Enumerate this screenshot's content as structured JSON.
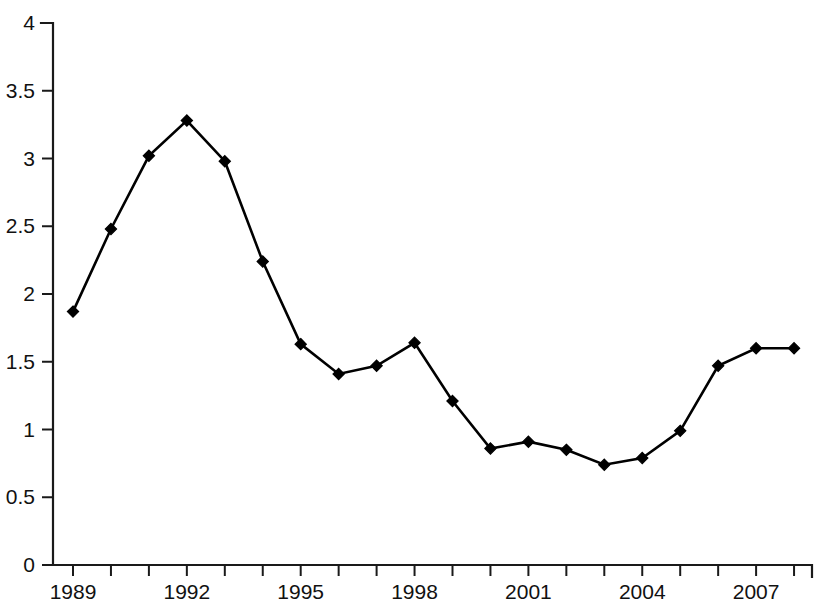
{
  "chart_data": {
    "type": "line",
    "title": "",
    "subtitle": "",
    "xlabel": "",
    "ylabel": "",
    "x": [
      1989,
      1990,
      1991,
      1992,
      1993,
      1994,
      1995,
      1996,
      1997,
      1998,
      1999,
      2000,
      2001,
      2002,
      2003,
      2004,
      2005,
      2006,
      2007,
      2008
    ],
    "values": [
      1.87,
      2.48,
      3.02,
      3.28,
      2.98,
      2.24,
      1.63,
      1.41,
      1.47,
      1.64,
      1.21,
      0.86,
      0.91,
      0.85,
      0.74,
      0.79,
      0.99,
      1.47,
      1.6,
      1.6
    ],
    "series": [
      {
        "name": "series-1",
        "values": [
          1.87,
          2.48,
          3.02,
          3.28,
          2.98,
          2.24,
          1.63,
          1.41,
          1.47,
          1.64,
          1.21,
          0.86,
          0.91,
          0.85,
          0.74,
          0.79,
          0.99,
          1.47,
          1.6,
          1.6
        ],
        "marker": "diamond",
        "color": "#000000"
      }
    ],
    "ylim": [
      0,
      4
    ],
    "xlim": [
      1988.5,
      2008.5
    ],
    "y_ticks": [
      0,
      0.5,
      1,
      1.5,
      2,
      2.5,
      3,
      3.5,
      4
    ],
    "y_tick_labels": [
      "0",
      "0.5",
      "1",
      "1.5",
      "2",
      "2.5",
      "3",
      "3.5",
      "4"
    ],
    "x_ticks": [
      1989,
      1990,
      1991,
      1992,
      1993,
      1994,
      1995,
      1996,
      1997,
      1998,
      1999,
      2000,
      2001,
      2002,
      2003,
      2004,
      2005,
      2006,
      2007,
      2008
    ],
    "x_tick_labels": [
      "1989",
      "",
      "",
      "1992",
      "",
      "",
      "1995",
      "",
      "",
      "1998",
      "",
      "",
      "2001",
      "",
      "",
      "2004",
      "",
      "",
      "2007",
      ""
    ],
    "x_labeled_ticks": [
      "1989",
      "1992",
      "1995",
      "1998",
      "2001",
      "2004",
      "2007"
    ],
    "grid": false,
    "legend": null,
    "legend_position": "none",
    "annotations": [],
    "background_color": "#ffffff",
    "line_color": "#000000",
    "axis_color": "#1a1a1a"
  }
}
